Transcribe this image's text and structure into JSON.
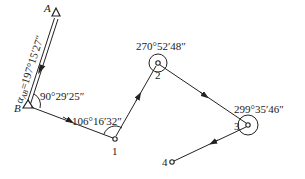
{
  "diagram": {
    "type": "traverse-survey",
    "known_points": [
      {
        "id": "A",
        "label": "A"
      },
      {
        "id": "B",
        "label": "B"
      }
    ],
    "stations": [
      {
        "id": "1",
        "label": "1"
      },
      {
        "id": "2",
        "label": "2"
      },
      {
        "id": "3",
        "label": "3"
      },
      {
        "id": "4",
        "label": "4"
      }
    ],
    "azimuth": {
      "symbol": "α",
      "subscript": "AB",
      "value": "=197°15′27″"
    },
    "angles": {
      "B": "90°29′25″",
      "1": "106°16′32″",
      "2": "270°52′48″",
      "3": "299°35′46″"
    },
    "colors": {
      "line": "#222222",
      "text": "#1a1a1a",
      "background": "#ffffff"
    }
  }
}
